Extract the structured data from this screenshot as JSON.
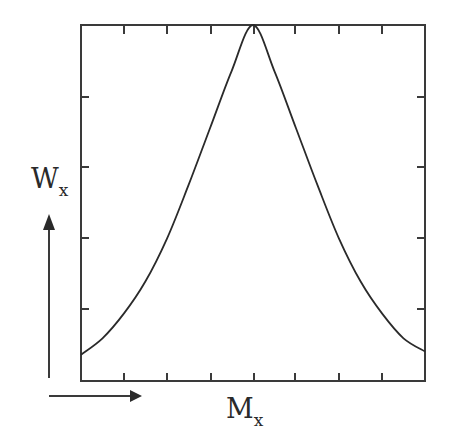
{
  "chart_data": {
    "type": "line",
    "title": "",
    "xlabel": "M",
    "xlabel_sub": "x",
    "ylabel": "W",
    "ylabel_sub": "x",
    "x_ticks_count": 7,
    "y_ticks_count": 4,
    "tick_labels": [],
    "grid": false,
    "legend": null,
    "series": [
      {
        "name": "W_x vs M_x",
        "shape": "bell-shaped, symmetric peak at center",
        "x": [
          0.0,
          0.0625,
          0.125,
          0.1875,
          0.25,
          0.3125,
          0.375,
          0.4375,
          0.5,
          0.5625,
          0.625,
          0.6875,
          0.75,
          0.8125,
          0.875,
          0.9375,
          1.0
        ],
        "values": [
          0.074,
          0.12,
          0.19,
          0.28,
          0.4,
          0.55,
          0.71,
          0.87,
          1.0,
          0.87,
          0.71,
          0.55,
          0.4,
          0.28,
          0.19,
          0.12,
          0.083
        ]
      }
    ],
    "xlim": [
      0,
      1
    ],
    "ylim": [
      0,
      1
    ],
    "colors": {
      "line": "#2a2a2a",
      "axes": "#3a3a3a",
      "background": "#ffffff"
    }
  }
}
